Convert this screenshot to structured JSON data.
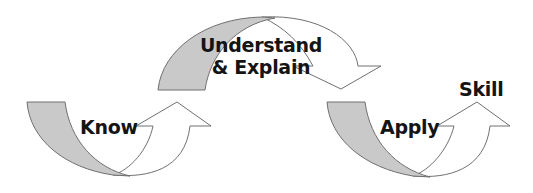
{
  "diagram": {
    "type": "process-flow",
    "colors": {
      "background": "#ffffff",
      "shaded_fill": "#c9c9c9",
      "outline": "#707070",
      "text": "#141414"
    },
    "stages": [
      {
        "id": "know",
        "label": "Know",
        "arrow_direction": "up-right"
      },
      {
        "id": "understand",
        "label_line1": "Understand",
        "label_line2": "& Explain",
        "arrow_direction": "down-right"
      },
      {
        "id": "apply",
        "label": "Apply",
        "arrow_direction": "up-right"
      },
      {
        "id": "skill",
        "label": "Skill"
      }
    ]
  }
}
